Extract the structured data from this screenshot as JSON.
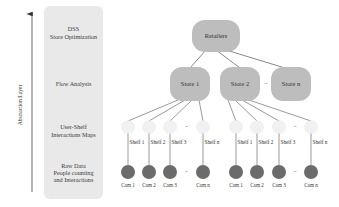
{
  "axis": {
    "label": "Abstraction Layer"
  },
  "layers": [
    {
      "lines": [
        "DSS",
        "Store Optimization"
      ]
    },
    {
      "lines": [
        "Flow Analysis"
      ]
    },
    {
      "lines": [
        "User-Shelf",
        "Interactions Maps"
      ]
    },
    {
      "lines": [
        "Raw Data",
        "People counting",
        "and Interactions"
      ]
    }
  ],
  "root": {
    "label": "Retailers"
  },
  "stores": [
    {
      "label": "Store 1"
    },
    {
      "label": "Store 2"
    },
    {
      "label": "Store n"
    }
  ],
  "ellipsis": "...",
  "store_groups": [
    {
      "store": 0,
      "shelves": [
        "Shelf 1",
        "Shelf 2",
        "Shelf 3",
        "Shelf n"
      ],
      "cams": [
        "Cam 1",
        "Cam 2",
        "Cam 3",
        "Cam n"
      ]
    },
    {
      "store": 1,
      "shelves": [
        "Shelf 1",
        "Shelf 2",
        "Shelf 3",
        "Shelf n"
      ],
      "cams": [
        "Cam 1",
        "Cam 2",
        "Cam 3",
        "Cam n"
      ]
    }
  ],
  "colors": {
    "panel": "#e9e9e9",
    "node": "#bdbdbd",
    "shelf": "#f1f1f1",
    "cam": "#6b6b6b",
    "line": "#555555"
  }
}
